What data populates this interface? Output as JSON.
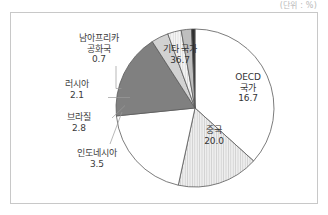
{
  "unit_label": "(단위 : %)",
  "chart_data": {
    "type": "pie",
    "title": "",
    "unit": "%",
    "legend_position": "none",
    "grid": false,
    "total": 100.0,
    "categories": [
      "기타 국가",
      "OECD 국가",
      "중국",
      "인도",
      "인도네시아",
      "브라질",
      "러시아",
      "남아프리카 공화국"
    ],
    "values": [
      36.7,
      16.7,
      20.0,
      17.5,
      3.5,
      2.8,
      2.1,
      0.7
    ],
    "slices": [
      {
        "name": "기타 국가",
        "label": "기타 국가",
        "value": "36.7",
        "value_num": 36.7,
        "fill": "#ffffff",
        "pattern": "none",
        "label_placement": "inside",
        "text_color": "#333333"
      },
      {
        "name": "OECD 국가",
        "label_line1": "OECD",
        "label_line2": "국가",
        "value": "16.7",
        "value_num": 16.7,
        "fill": "#e8e8e8",
        "pattern": "vertical-hatch",
        "label_placement": "inside",
        "text_color": "#333333"
      },
      {
        "name": "중국",
        "label": "중국",
        "value": "20.0",
        "value_num": 20.0,
        "fill": "#ffffff",
        "pattern": "none",
        "label_placement": "inside",
        "text_color": "#333333"
      },
      {
        "name": "인도",
        "label": "인도",
        "value": "17.5",
        "value_num": 17.5,
        "fill": "#808080",
        "pattern": "none",
        "label_placement": "inside",
        "text_color": "#ffffff"
      },
      {
        "name": "인도네시아",
        "label": "인도네시아",
        "value": "3.5",
        "value_num": 3.5,
        "fill": "#d2d2d2",
        "pattern": "none",
        "label_placement": "callout",
        "text_color": "#3b3b3b"
      },
      {
        "name": "브라질",
        "label": "브라질",
        "value": "2.8",
        "value_num": 2.8,
        "fill": "#efefef",
        "pattern": "vertical-hatch",
        "label_placement": "callout",
        "text_color": "#3b3b3b"
      },
      {
        "name": "러시아",
        "label": "러시아",
        "value": "2.1",
        "value_num": 2.1,
        "fill": "#bfbfbf",
        "pattern": "none",
        "label_placement": "callout",
        "text_color": "#3b3b3b"
      },
      {
        "name": "남아프리카 공화국",
        "label_line1": "남아프리카",
        "label_line2": "공화국",
        "value": "0.7",
        "value_num": 0.7,
        "fill": "#2e2e2e",
        "pattern": "none",
        "label_placement": "callout",
        "text_color": "#3b3b3b"
      }
    ]
  }
}
